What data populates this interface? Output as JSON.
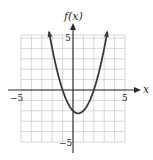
{
  "chart_data": {
    "type": "line",
    "title": "",
    "function": "f(x) = x^2 - x - 2",
    "xlabel": "x",
    "ylabel": "f(x)",
    "xlim": [
      -5,
      5
    ],
    "ylim": [
      -5,
      5
    ],
    "grid": true,
    "grid_step": 1,
    "x_tick_labels": [
      {
        "value": -5,
        "label": "−5"
      },
      {
        "value": 5,
        "label": "5"
      }
    ],
    "y_tick_labels": [
      {
        "value": 5,
        "label": "5"
      },
      {
        "value": -5,
        "label": "−5"
      }
    ],
    "series": [
      {
        "name": "f(x)",
        "x": [
          -2.3,
          -2,
          -1.5,
          -1,
          -0.5,
          0,
          0.5,
          1,
          1.5,
          2,
          2.5,
          3,
          3.3
        ],
        "y": [
          5.59,
          4,
          1.75,
          0,
          -1.25,
          -2,
          -2.25,
          -2,
          -1.25,
          0,
          1.75,
          4,
          5.59
        ]
      }
    ],
    "key_points": {
      "vertex": [
        0.5,
        -2.25
      ],
      "x_intercepts": [
        -1,
        2
      ],
      "y_intercept": -2
    },
    "legend": "none",
    "colors": {
      "curve": "#3a3a3a",
      "axes": "#2a2a2a",
      "grid": "#bdbdbd"
    }
  },
  "labels": {
    "y_axis": "f(x)",
    "x_axis": "x",
    "x_min": "−5",
    "x_max": "5",
    "y_max": "5",
    "y_min": "−5"
  }
}
